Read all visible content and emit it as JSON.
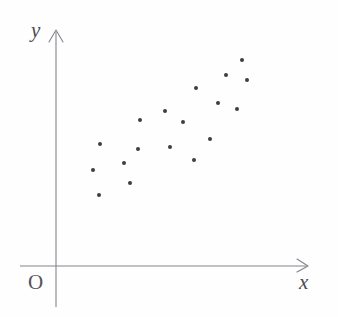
{
  "figure": {
    "kind": "scatter-plot-diagram",
    "width": 338,
    "height": 317,
    "background_color": "#fefefe"
  },
  "axes": {
    "x_axis": {
      "label": "x",
      "label_style": "italic-serif",
      "color": "#83838b",
      "start_px": 20,
      "end_px": 308,
      "y_px": 266,
      "has_arrowhead": true
    },
    "y_axis": {
      "label": "y",
      "label_style": "italic-serif",
      "color": "#83838b",
      "start_px": 307,
      "end_px": 30,
      "x_px": 56,
      "has_arrowhead": true
    },
    "origin": {
      "label": "O",
      "label_style": "serif"
    }
  },
  "chart_data": {
    "type": "scatter",
    "title": "",
    "xlabel": "x",
    "ylabel": "y",
    "grid": false,
    "legend": false,
    "point_color": "#3d3d45",
    "point_radius_px": 2.0,
    "n_points": 18,
    "relationship": "positive linear correlation",
    "xlim": [
      0,
      1
    ],
    "ylim": [
      0,
      1
    ],
    "points_px": [
      {
        "x": 100,
        "y": 144
      },
      {
        "x": 93,
        "y": 170
      },
      {
        "x": 99,
        "y": 195
      },
      {
        "x": 124,
        "y": 163
      },
      {
        "x": 130,
        "y": 183
      },
      {
        "x": 138,
        "y": 149
      },
      {
        "x": 140,
        "y": 120
      },
      {
        "x": 165,
        "y": 111
      },
      {
        "x": 170,
        "y": 147
      },
      {
        "x": 183,
        "y": 122
      },
      {
        "x": 194,
        "y": 160
      },
      {
        "x": 196,
        "y": 88
      },
      {
        "x": 210,
        "y": 139
      },
      {
        "x": 218,
        "y": 103
      },
      {
        "x": 226,
        "y": 75
      },
      {
        "x": 237,
        "y": 109
      },
      {
        "x": 242,
        "y": 60
      },
      {
        "x": 247,
        "y": 80
      }
    ],
    "points_data": [
      {
        "x": 0.175,
        "y": 0.517
      },
      {
        "x": 0.148,
        "y": 0.407
      },
      {
        "x": 0.171,
        "y": 0.301
      },
      {
        "x": 0.27,
        "y": 0.436
      },
      {
        "x": 0.294,
        "y": 0.351
      },
      {
        "x": 0.325,
        "y": 0.496
      },
      {
        "x": 0.333,
        "y": 0.619
      },
      {
        "x": 0.432,
        "y": 0.657
      },
      {
        "x": 0.452,
        "y": 0.504
      },
      {
        "x": 0.503,
        "y": 0.611
      },
      {
        "x": 0.546,
        "y": 0.449
      },
      {
        "x": 0.554,
        "y": 0.754
      },
      {
        "x": 0.61,
        "y": 0.538
      },
      {
        "x": 0.642,
        "y": 0.691
      },
      {
        "x": 0.674,
        "y": 0.81
      },
      {
        "x": 0.718,
        "y": 0.665
      },
      {
        "x": 0.738,
        "y": 0.873
      },
      {
        "x": 0.758,
        "y": 0.788
      }
    ]
  }
}
